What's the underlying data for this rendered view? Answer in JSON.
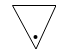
{
  "icon": {
    "name": "triangle-down-with-dot",
    "stroke_color": "#000000",
    "fill_color": "#ffffff",
    "dot_color": "#000000"
  }
}
